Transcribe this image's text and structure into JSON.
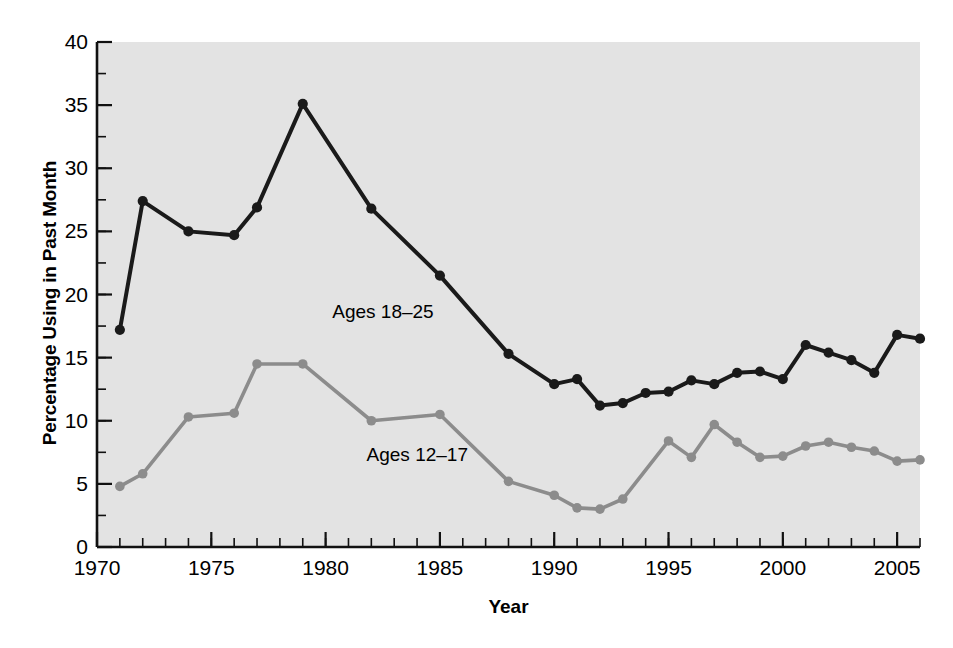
{
  "chart_data": {
    "type": "line",
    "title": "",
    "xlabel": "Year",
    "ylabel": "Percentage Using in Past Month",
    "xlim": [
      1970,
      2006
    ],
    "ylim": [
      0,
      40
    ],
    "yticks": [
      0,
      5,
      10,
      15,
      20,
      25,
      30,
      35,
      40
    ],
    "xticks": [
      1970,
      1975,
      1980,
      1985,
      1990,
      1995,
      2000,
      2005
    ],
    "xtick_labels": [
      "1970",
      "1975",
      "1980",
      "1985",
      "1990",
      "1995",
      "2000",
      "2005"
    ],
    "ytick_labels": [
      "0",
      "5",
      "10",
      "15",
      "20",
      "25",
      "30",
      "35",
      "40"
    ],
    "x_minor_tick_step": 1,
    "y_minor_tick_step": 2.5,
    "grid": false,
    "legend_position": "inline-annotations",
    "plot_background": "#e3e3e3",
    "figure_background": "#ffffff",
    "series": [
      {
        "name": "Ages 18-25",
        "label": "Ages 18–25",
        "color": "#1a1a1a",
        "marker": "circle",
        "annotation": {
          "text": "Ages 18–25",
          "x": 1982.5,
          "y": 18.5
        },
        "points": [
          {
            "x": 1971,
            "y": 17.2
          },
          {
            "x": 1972,
            "y": 27.4
          },
          {
            "x": 1974,
            "y": 25.0
          },
          {
            "x": 1976,
            "y": 24.7
          },
          {
            "x": 1977,
            "y": 26.9
          },
          {
            "x": 1979,
            "y": 35.1
          },
          {
            "x": 1982,
            "y": 26.8
          },
          {
            "x": 1985,
            "y": 21.5
          },
          {
            "x": 1988,
            "y": 15.3
          },
          {
            "x": 1990,
            "y": 12.9
          },
          {
            "x": 1991,
            "y": 13.3
          },
          {
            "x": 1992,
            "y": 11.2
          },
          {
            "x": 1993,
            "y": 11.4
          },
          {
            "x": 1994,
            "y": 12.2
          },
          {
            "x": 1995,
            "y": 12.3
          },
          {
            "x": 1996,
            "y": 13.2
          },
          {
            "x": 1997,
            "y": 12.9
          },
          {
            "x": 1998,
            "y": 13.8
          },
          {
            "x": 1999,
            "y": 13.9
          },
          {
            "x": 2000,
            "y": 13.3
          },
          {
            "x": 2001,
            "y": 16.0
          },
          {
            "x": 2002,
            "y": 15.4
          },
          {
            "x": 2003,
            "y": 14.8
          },
          {
            "x": 2004,
            "y": 13.8
          },
          {
            "x": 2005,
            "y": 16.8
          },
          {
            "x": 2006,
            "y": 16.5
          }
        ]
      },
      {
        "name": "Ages 12-17",
        "label": "Ages 12–17",
        "color": "#8c8c8c",
        "marker": "circle",
        "annotation": {
          "text": "Ages 12–17",
          "x": 1984.0,
          "y": 7.2
        },
        "points": [
          {
            "x": 1971,
            "y": 4.8
          },
          {
            "x": 1972,
            "y": 5.8
          },
          {
            "x": 1974,
            "y": 10.3
          },
          {
            "x": 1976,
            "y": 10.6
          },
          {
            "x": 1977,
            "y": 14.5
          },
          {
            "x": 1979,
            "y": 14.5
          },
          {
            "x": 1982,
            "y": 10.0
          },
          {
            "x": 1985,
            "y": 10.5
          },
          {
            "x": 1988,
            "y": 5.2
          },
          {
            "x": 1990,
            "y": 4.1
          },
          {
            "x": 1991,
            "y": 3.1
          },
          {
            "x": 1992,
            "y": 3.0
          },
          {
            "x": 1993,
            "y": 3.8
          },
          {
            "x": 1995,
            "y": 8.4
          },
          {
            "x": 1996,
            "y": 7.1
          },
          {
            "x": 1997,
            "y": 9.7
          },
          {
            "x": 1998,
            "y": 8.3
          },
          {
            "x": 1999,
            "y": 7.1
          },
          {
            "x": 2000,
            "y": 7.2
          },
          {
            "x": 2001,
            "y": 8.0
          },
          {
            "x": 2002,
            "y": 8.3
          },
          {
            "x": 2003,
            "y": 7.9
          },
          {
            "x": 2004,
            "y": 7.6
          },
          {
            "x": 2005,
            "y": 6.8
          },
          {
            "x": 2006,
            "y": 6.9
          }
        ]
      }
    ]
  },
  "axes": {
    "ylabel": "Percentage Using in Past Month",
    "xlabel": "Year"
  }
}
